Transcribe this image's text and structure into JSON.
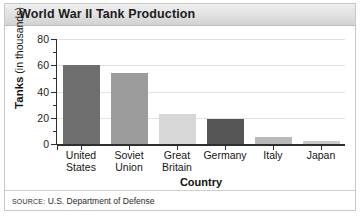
{
  "title": "World War II Tank Production",
  "source": {
    "prefix": "SOURCE:",
    "text": "U.S. Department of Defense"
  },
  "axis": {
    "y_title_strong": "Tanks",
    "y_title_rest": " (in thousands)",
    "x_title": "Country"
  },
  "chart_data": {
    "type": "bar",
    "title": "World War II Tank Production",
    "xlabel": "Country",
    "ylabel": "Tanks (in thousands)",
    "ylim": [
      0,
      80
    ],
    "yticks": [
      0,
      20,
      40,
      60,
      80
    ],
    "ytick_labels": [
      "0",
      "20",
      "40",
      "60",
      "80"
    ],
    "grid": true,
    "legend": false,
    "categories": [
      "United States",
      "Soviet Union",
      "Great Britain",
      "Germany",
      "Italy",
      "Japan"
    ],
    "category_lines": [
      [
        "United",
        "States"
      ],
      [
        "Soviet",
        "Union"
      ],
      [
        "Great",
        "Britain"
      ],
      [
        "Germany"
      ],
      [
        "Italy"
      ],
      [
        "Japan"
      ]
    ],
    "values": [
      60,
      54,
      23,
      19,
      5,
      2.5
    ],
    "bar_colors": [
      "#6e6e6e",
      "#9b9b9b",
      "#d7d7d7",
      "#555555",
      "#b9b9b9",
      "#c9c9c9"
    ],
    "units": "thousands of tanks"
  },
  "colors": {
    "grid": "#e2e2e2",
    "axis": "#2e2e2e",
    "title_text": "#1c1c1c",
    "frame": "#c9c9c9"
  }
}
